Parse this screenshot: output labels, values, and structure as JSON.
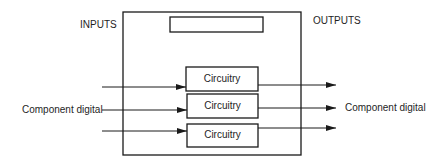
{
  "diagram": {
    "labels": {
      "inputs": "INPUTS",
      "outputs": "OUTPUTS",
      "input_signal": "Component digital",
      "output_signal": "Component digital"
    },
    "blocks": [
      {
        "label": "Circuitry"
      },
      {
        "label": "Circuitry"
      },
      {
        "label": "Circuitry"
      }
    ],
    "top_block": {
      "label": ""
    },
    "colors": {
      "stroke": "#1a1a1a",
      "background": "#ffffff"
    }
  }
}
